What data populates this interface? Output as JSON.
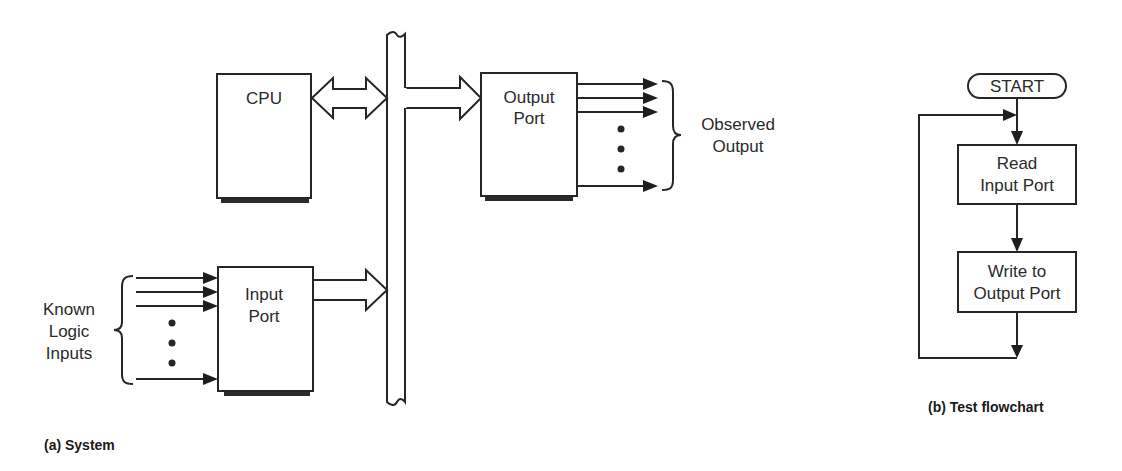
{
  "system_diagram": {
    "caption": "(a) System",
    "cpu": {
      "label": "CPU"
    },
    "output_port": {
      "label_line1": "Output",
      "label_line2": "Port"
    },
    "input_port": {
      "label_line1": "Input",
      "label_line2": "Port"
    },
    "observed_output": {
      "line1": "Observed",
      "line2": "Output"
    },
    "known_inputs": {
      "line1": "Known",
      "line2": "Logic",
      "line3": "Inputs"
    }
  },
  "flowchart": {
    "caption": "(b) Test flowchart",
    "start": {
      "label": "START"
    },
    "read_step": {
      "line1": "Read",
      "line2": "Input Port"
    },
    "write_step": {
      "line1": "Write to",
      "line2": "Output Port"
    }
  },
  "colors": {
    "line": "#262626",
    "background": "#ffffff"
  }
}
